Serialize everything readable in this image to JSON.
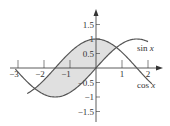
{
  "diagram": {
    "type": "function-plot",
    "x_ticks": [
      {
        "v": -3,
        "label": "−3"
      },
      {
        "v": -2,
        "label": "−2"
      },
      {
        "v": -1,
        "label": "−1"
      },
      {
        "v": 1,
        "label": "1"
      },
      {
        "v": 2,
        "label": "2"
      }
    ],
    "y_ticks": [
      {
        "v": 1.5,
        "label": "1.5"
      },
      {
        "v": 1,
        "label": "1"
      },
      {
        "v": 0.5,
        "label": "0.5"
      },
      {
        "v": -0.5,
        "label": "−0.5"
      },
      {
        "v": -1,
        "label": "−1"
      },
      {
        "v": -1.5,
        "label": "−1.5"
      }
    ],
    "curves": [
      {
        "name": "sin",
        "label_fn": "sin",
        "label_var": "x"
      },
      {
        "name": "cos",
        "label_fn": "cos",
        "label_var": "x"
      }
    ],
    "shaded_region": "between cos x and sin x from -3π/4 to π/4",
    "colors": {
      "curve": "#555555",
      "shade": "#e0e0e0",
      "axis": "#333333"
    }
  }
}
